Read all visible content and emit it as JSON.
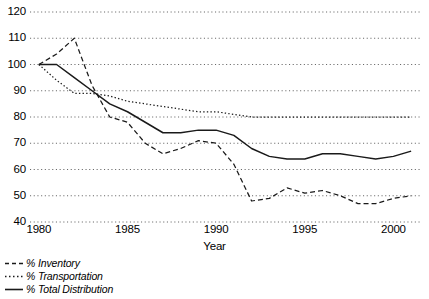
{
  "chart_data": {
    "type": "line",
    "title": "",
    "xlabel": "Year",
    "ylabel": "",
    "xlim": [
      1979.5,
      2001.5
    ],
    "ylim": [
      40,
      120
    ],
    "grid": true,
    "grid_style": "dotted-horizontal",
    "legend_position": "below-left",
    "x_ticks": [
      1980,
      1985,
      1990,
      1995,
      2000
    ],
    "x_tick_labels": [
      "1980",
      "1985",
      "1990",
      "1995",
      "2000"
    ],
    "y_ticks": [
      40,
      50,
      60,
      70,
      80,
      90,
      100,
      110,
      120
    ],
    "y_tick_labels": [
      "40",
      "50",
      "60",
      "70",
      "80",
      "90",
      "100",
      "110",
      "120"
    ],
    "x": [
      1980,
      1981,
      1982,
      1983,
      1984,
      1985,
      1986,
      1987,
      1988,
      1989,
      1990,
      1991,
      1992,
      1993,
      1994,
      1995,
      1996,
      1997,
      1998,
      1999,
      2000,
      2001
    ],
    "series": [
      {
        "name": "% Inventory",
        "style": "dashed",
        "color": "#1a1a1a",
        "values": [
          100,
          104,
          110,
          92,
          80,
          78,
          70,
          66,
          68,
          71,
          70,
          62,
          48,
          49,
          53,
          51,
          52,
          50,
          47,
          47,
          49,
          50
        ]
      },
      {
        "name": "% Transportation",
        "style": "dotted",
        "color": "#1a1a1a",
        "values": [
          100,
          94,
          89,
          89,
          88,
          86,
          85,
          84,
          83,
          82,
          82,
          81,
          80,
          80,
          80,
          80,
          80,
          80,
          80,
          80,
          80,
          80
        ]
      },
      {
        "name": "% Total Distribution",
        "style": "solid",
        "color": "#1a1a1a",
        "values": [
          100,
          100,
          95,
          90,
          85,
          82,
          78,
          74,
          74,
          75,
          75,
          73,
          68,
          65,
          64,
          64,
          66,
          66,
          65,
          64,
          65,
          67
        ]
      }
    ]
  },
  "legend": {
    "items": [
      {
        "label": "% Inventory",
        "style": "dashed"
      },
      {
        "label": "% Transportation",
        "style": "dotted"
      },
      {
        "label": "% Total Distribution",
        "style": "solid"
      }
    ]
  },
  "axis": {
    "x_title": "Year"
  }
}
